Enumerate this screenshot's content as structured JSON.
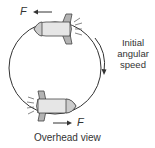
{
  "diagram": {
    "type": "physics-free-body",
    "labels": {
      "force_top": "F",
      "force_bottom": "F",
      "rotation_line1": "Initial",
      "rotation_line2": "angular",
      "rotation_line3": "speed",
      "caption": "Overhead view"
    },
    "elements": [
      {
        "name": "circular-path",
        "shape": "circle"
      },
      {
        "name": "rocket-top",
        "direction": "left"
      },
      {
        "name": "rocket-bottom",
        "direction": "right"
      },
      {
        "name": "force-arrow-top",
        "direction": "left"
      },
      {
        "name": "force-arrow-bottom",
        "direction": "right"
      },
      {
        "name": "angular-speed-arrow",
        "direction": "clockwise"
      }
    ],
    "colors": {
      "stroke": "#333333",
      "rocket_fill": "#e6e6e6",
      "rocket_tip_fill": "#cccccc",
      "fin_fill": "#b3b3b3"
    }
  }
}
